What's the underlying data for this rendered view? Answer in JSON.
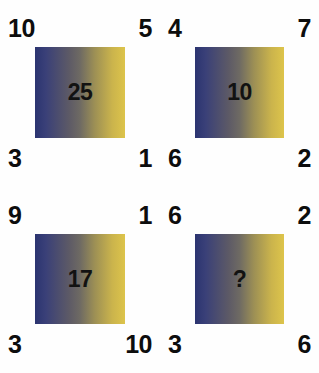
{
  "puzzle": {
    "type": "visual-number-logic-puzzle",
    "background_color": "#fefefe",
    "text_color": "#0d0d0d",
    "gradient_start_color": "#2b3470",
    "gradient_mid_color": "#6e6a63",
    "gradient_end_color": "#ddc44b",
    "unknown_marker": "?",
    "grid": {
      "rows": 2,
      "columns": 2
    },
    "panels": [
      {
        "id": "panel-1",
        "position": "top-left",
        "top_left": "10",
        "top_right": "5",
        "bottom_left": "3",
        "bottom_right": "1",
        "center": "25"
      },
      {
        "id": "panel-2",
        "position": "top-right",
        "top_left": "4",
        "top_right": "7",
        "bottom_left": "6",
        "bottom_right": "2",
        "center": "10"
      },
      {
        "id": "panel-3",
        "position": "bottom-left",
        "top_left": "9",
        "top_right": "1",
        "bottom_left": "3",
        "bottom_right": "10",
        "center": "17"
      },
      {
        "id": "panel-4",
        "position": "bottom-right",
        "top_left": "6",
        "top_right": "2",
        "bottom_left": "3",
        "bottom_right": "6",
        "center": "?"
      }
    ]
  }
}
